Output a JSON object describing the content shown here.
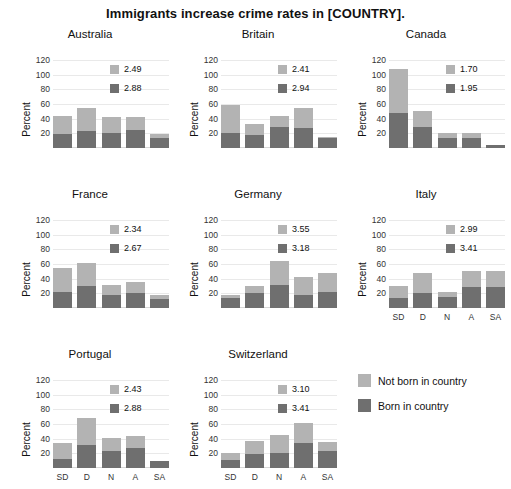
{
  "figure": {
    "title": "Immigrants increase crime rates in [COUNTRY]."
  },
  "legend": {
    "items": [
      {
        "label": "Not born in country",
        "color": "#b3b3b3",
        "key": "not_born"
      },
      {
        "label": "Born in country",
        "color": "#6f6f6f",
        "key": "born"
      }
    ]
  },
  "axes": {
    "ylabel": "Percent",
    "yticks": [
      20,
      40,
      60,
      80,
      100,
      120
    ],
    "ylim": [
      0,
      120
    ],
    "xticks": [
      "SD",
      "D",
      "N",
      "A",
      "SA"
    ],
    "grid": true
  },
  "chart_data": {
    "type": "bar",
    "title": "Immigrants increase crime rates in [COUNTRY].",
    "subtitle": "",
    "xlabel": "",
    "ylabel": "Percent",
    "ylim": [
      0,
      120
    ],
    "yticks": [
      20,
      40,
      60,
      80,
      100,
      120
    ],
    "categories": [
      "SD",
      "D",
      "N",
      "A",
      "SA"
    ],
    "stacked": true,
    "grid": true,
    "legend_position": "bottom-right",
    "series_names": [
      "Not born in country",
      "Born in country"
    ],
    "series_colors": [
      "#b3b3b3",
      "#6f6f6f"
    ],
    "panel_annotation_note": "Each panel shows two mean values: light (not born in country) and dark (born in country).",
    "panels": [
      {
        "name": "Australia",
        "means": {
          "not_born": "2.49",
          "born": "2.88"
        },
        "series": [
          {
            "name": "Not born in country",
            "values": [
              24,
              32,
              21,
              18,
              5
            ]
          },
          {
            "name": "Born in country",
            "values": [
              19,
              23,
              21,
              24,
              14
            ]
          }
        ],
        "totals": [
          43,
          55,
          42,
          42,
          19
        ]
      },
      {
        "name": "Britain",
        "means": {
          "not_born": "2.41",
          "born": "2.94"
        },
        "series": [
          {
            "name": "Not born in country",
            "values": [
              37,
              15,
              15,
              28,
              1
            ]
          },
          {
            "name": "Born in country",
            "values": [
              21,
              18,
              28,
              27,
              14
            ]
          }
        ],
        "totals": [
          58,
          33,
          43,
          55,
          15
        ]
      },
      {
        "name": "Canada",
        "means": {
          "not_born": "1.70",
          "born": "1.95"
        },
        "series": [
          {
            "name": "Not born in country",
            "values": [
              60,
              22,
              6,
              8,
              0
            ]
          },
          {
            "name": "Born in country",
            "values": [
              48,
              29,
              14,
              13,
              4
            ]
          }
        ],
        "totals": [
          108,
          51,
          20,
          21,
          4
        ]
      },
      {
        "name": "France",
        "means": {
          "not_born": "2.34",
          "born": "2.67"
        },
        "series": [
          {
            "name": "Not born in country",
            "values": [
              32,
              32,
              14,
              15,
              6
            ]
          },
          {
            "name": "Born in country",
            "values": [
              22,
              30,
              18,
              20,
              12
            ]
          }
        ],
        "totals": [
          54,
          62,
          32,
          35,
          18
        ]
      },
      {
        "name": "Germany",
        "means": {
          "not_born": "3.55",
          "born": "3.18"
        },
        "series": [
          {
            "name": "Not born in country",
            "values": [
              5,
              10,
              32,
              24,
              26
            ]
          },
          {
            "name": "Born in country",
            "values": [
              13,
              20,
              32,
              18,
              22
            ]
          }
        ],
        "totals": [
          18,
          30,
          64,
          42,
          48
        ]
      },
      {
        "name": "Italy",
        "means": {
          "not_born": "2.99",
          "born": "3.41"
        },
        "series": [
          {
            "name": "Not born in country",
            "values": [
              17,
              28,
              7,
              23,
              21
            ]
          },
          {
            "name": "Born in country",
            "values": [
              13,
              20,
              15,
              28,
              29
            ]
          }
        ],
        "totals": [
          30,
          48,
          22,
          51,
          50
        ]
      },
      {
        "name": "Portugal",
        "means": {
          "not_born": "2.43",
          "born": "2.88"
        },
        "series": [
          {
            "name": "Not born in country",
            "values": [
              22,
              36,
              18,
              17,
              0
            ]
          },
          {
            "name": "Born in country",
            "values": [
              12,
              32,
              23,
              27,
              10
            ]
          }
        ],
        "totals": [
          34,
          68,
          41,
          44,
          10
        ]
      },
      {
        "name": "Switzerland",
        "means": {
          "not_born": "3.10",
          "born": "3.41"
        },
        "series": [
          {
            "name": "Not born in country",
            "values": [
              10,
              18,
              24,
              27,
              13
            ]
          },
          {
            "name": "Born in country",
            "values": [
              11,
              19,
              21,
              34,
              23
            ]
          }
        ],
        "totals": [
          21,
          37,
          45,
          61,
          36
        ]
      }
    ]
  }
}
